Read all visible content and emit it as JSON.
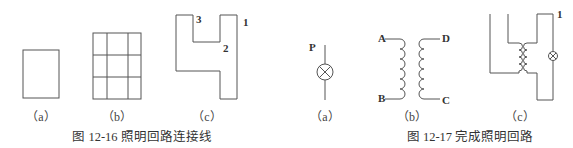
{
  "figures": [
    {
      "id": "fig-12-16",
      "caption": "图 12-16    照明回路连接线",
      "panels": [
        {
          "label": "（a）",
          "shape": "rectangle"
        },
        {
          "label": "（b）",
          "shape": "3x3-grid"
        },
        {
          "label": "（c）",
          "shape": "h-shaped-loop",
          "points": [
            "1",
            "2",
            "3"
          ]
        }
      ]
    },
    {
      "id": "fig-12-17",
      "caption": "图 12-17    完成照明回路",
      "panels": [
        {
          "label": "（a）",
          "shape": "lamp-symbol",
          "terminal": "P"
        },
        {
          "label": "（b）",
          "shape": "transformer-coils",
          "terminals": [
            "A",
            "D",
            "B",
            "C"
          ]
        },
        {
          "label": "（c）",
          "shape": "completed-lighting-circuit",
          "points": [
            "1"
          ]
        }
      ]
    }
  ],
  "labels": {
    "f16_c_p1": "1",
    "f16_c_p2": "2",
    "f16_c_p3": "3",
    "f17_a_p": "P",
    "f17_b_a": "A",
    "f17_b_d": "D",
    "f17_b_b": "B",
    "f17_b_c": "C",
    "f17_c_p1": "1"
  }
}
